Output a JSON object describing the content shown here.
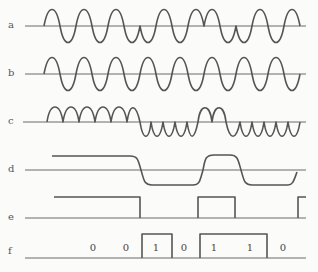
{
  "figure": {
    "rows": [
      {
        "id": "a",
        "label": "a",
        "baseline_y": 26,
        "type": "modulated-sine"
      },
      {
        "id": "b",
        "label": "b",
        "baseline_y": 74,
        "type": "carrier-sine"
      },
      {
        "id": "c",
        "label": "c",
        "baseline_y": 122,
        "type": "rectified-sine"
      },
      {
        "id": "d",
        "label": "d",
        "baseline_y": 170,
        "type": "smoothed-level"
      },
      {
        "id": "e",
        "label": "e",
        "baseline_y": 218,
        "type": "square-pulse"
      },
      {
        "id": "f",
        "label": "f",
        "baseline_y": 258,
        "type": "bit-sequence"
      }
    ],
    "bits": [
      {
        "value": "0",
        "x": 93
      },
      {
        "value": "0",
        "x": 126
      },
      {
        "value": "1",
        "x": 156
      },
      {
        "value": "0",
        "x": 184
      },
      {
        "value": "1",
        "x": 214
      },
      {
        "value": "1",
        "x": 250
      },
      {
        "value": "0",
        "x": 283
      }
    ],
    "colors": {
      "line": "#555555",
      "axis": "#6a6a6a",
      "background": "#fbfbfa"
    }
  }
}
